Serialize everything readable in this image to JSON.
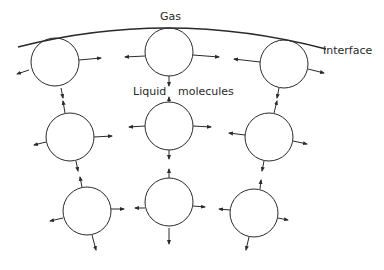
{
  "labels": {
    "gas": "Gas",
    "interface": "Interface",
    "liquid": "Liquid",
    "molecules": "molecules"
  },
  "colors": {
    "line": "#2a2a2a",
    "background": "#ffffff"
  },
  "molecules": [
    {
      "row": "top",
      "col": "left",
      "cx": 55,
      "cy": 62,
      "r": 24,
      "arrows": [
        [
          29,
          70,
          -12,
          4
        ],
        [
          79,
          60,
          22,
          -2
        ],
        [
          61,
          88,
          2,
          10
        ]
      ]
    },
    {
      "row": "top",
      "col": "center",
      "cx": 169,
      "cy": 52,
      "r": 24,
      "arrows": [
        [
          145,
          56,
          -20,
          1
        ],
        [
          193,
          55,
          26,
          2
        ],
        [
          169,
          76,
          0,
          10
        ]
      ]
    },
    {
      "row": "top",
      "col": "right",
      "cx": 284,
      "cy": 64,
      "r": 24,
      "arrows": [
        [
          260,
          62,
          -26,
          -3
        ],
        [
          308,
          69,
          16,
          4
        ],
        [
          279,
          88,
          -2,
          10
        ]
      ]
    },
    {
      "row": "middle",
      "col": "left",
      "cx": 70,
      "cy": 137,
      "r": 24,
      "arrows": [
        [
          46,
          142,
          -12,
          3
        ],
        [
          94,
          137,
          18,
          -1
        ],
        [
          65,
          113,
          -2,
          -12
        ],
        [
          76,
          161,
          2,
          10
        ]
      ]
    },
    {
      "row": "middle",
      "col": "center",
      "cx": 169,
      "cy": 126,
      "r": 24,
      "arrows": [
        [
          145,
          126,
          -16,
          1
        ],
        [
          193,
          126,
          18,
          1
        ],
        [
          169,
          102,
          0,
          -5
        ],
        [
          169,
          150,
          0,
          9
        ]
      ]
    },
    {
      "row": "middle",
      "col": "right",
      "cx": 269,
      "cy": 137,
      "r": 24,
      "arrows": [
        [
          245,
          135,
          -16,
          -2
        ],
        [
          293,
          141,
          14,
          3
        ],
        [
          274,
          113,
          3,
          -12
        ],
        [
          264,
          161,
          -2,
          10
        ]
      ]
    },
    {
      "row": "bottom",
      "col": "left",
      "cx": 87,
      "cy": 211,
      "r": 24,
      "arrows": [
        [
          63,
          218,
          -13,
          3
        ],
        [
          111,
          209,
          13,
          0
        ],
        [
          82,
          187,
          -2,
          -10
        ],
        [
          92,
          235,
          4,
          15
        ]
      ]
    },
    {
      "row": "bottom",
      "col": "center",
      "cx": 169,
      "cy": 202,
      "r": 24,
      "arrows": [
        [
          145,
          208,
          -10,
          0
        ],
        [
          193,
          206,
          12,
          1
        ],
        [
          169,
          178,
          0,
          -9
        ],
        [
          169,
          228,
          0,
          16
        ]
      ]
    },
    {
      "row": "bottom",
      "col": "right",
      "cx": 254,
      "cy": 213,
      "r": 24,
      "arrows": [
        [
          230,
          210,
          -11,
          -1
        ],
        [
          278,
          218,
          10,
          2
        ],
        [
          260,
          189,
          1,
          -9
        ],
        [
          249,
          237,
          -3,
          13
        ]
      ]
    }
  ]
}
